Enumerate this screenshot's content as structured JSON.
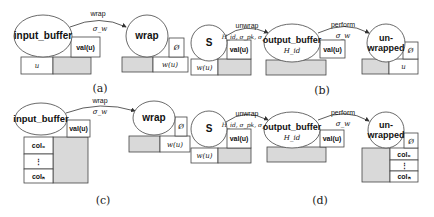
{
  "figure": {
    "panels": [
      {
        "caption": "(a)",
        "nodes": {
          "input_buffer": {
            "label": "input_buffer",
            "val": "val(u)",
            "cell": "u"
          },
          "wrap": {
            "label": "wrap",
            "empty": "Ø",
            "cell": "w(u)"
          }
        },
        "edge": {
          "label": "wrap",
          "sublabel": "σ_w"
        }
      },
      {
        "caption": "(b)",
        "nodes": {
          "s": {
            "label": "S",
            "cell": "w(u)",
            "val": "val(u)"
          },
          "output_buffer": {
            "label": "output_buffer",
            "sub": "H_id",
            "val": "val(u)"
          },
          "unwrapped": {
            "label_line1": "un-",
            "label_line2": "wrapped",
            "empty": "Ø",
            "cell": "u"
          }
        },
        "edges": [
          {
            "label": "unwrap",
            "sublabel": "H_id, σ_pk, σ_w"
          },
          {
            "label": "perform",
            "sublabel": "σ_w"
          }
        ]
      },
      {
        "caption": "(c)",
        "nodes": {
          "input_buffer": {
            "label": "input_buffer",
            "val": "val(u)",
            "cols": [
              "col₀",
              "⋮",
              "colₙ"
            ]
          },
          "wrap": {
            "label": "wrap",
            "empty": "Ø",
            "cell": "w(u)"
          }
        },
        "edge": {
          "label": "wrap",
          "sublabel": "σ_w"
        }
      },
      {
        "caption": "(d)",
        "nodes": {
          "s": {
            "label": "S",
            "cell": "w(u)",
            "val": "val(u)"
          },
          "output_buffer": {
            "label": "output_buffer",
            "sub": "H_id",
            "val": "val(u)"
          },
          "unwrapped": {
            "label_line1": "un-",
            "label_line2": "wrapped",
            "empty": "Ø",
            "cols": [
              "col₀",
              "⋮",
              "colₙ"
            ]
          }
        },
        "edges": [
          {
            "label": "unwrap",
            "sublabel": "H_id, σ_pk, σ_w"
          },
          {
            "label": "perform",
            "sublabel": "σ_w"
          }
        ]
      }
    ],
    "colors": {
      "gray_fill": "#d9d9d9",
      "stroke": "#444444"
    }
  }
}
